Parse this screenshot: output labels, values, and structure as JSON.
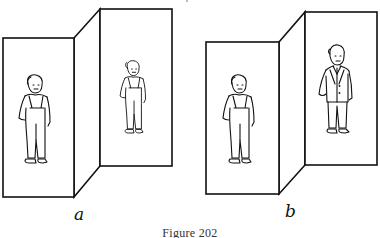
{
  "figure": {
    "caption": "Figure 202",
    "panels": [
      {
        "label": "a",
        "description": "Folding screen with two panels; near panel shows a boy in overalls, far panel shows the same boy drawn smaller",
        "near_figure": "boy-in-overalls",
        "far_figure": "boy-in-overalls-small"
      },
      {
        "label": "b",
        "description": "Folding screen with two panels; near panel shows a boy in overalls, far panel shows a man in a suit of similar drawn size",
        "near_figure": "boy-in-overalls",
        "far_figure": "man-in-suit"
      }
    ]
  },
  "colors": {
    "ink": "#111111",
    "paper": "#ffffff",
    "caption": "#333333"
  }
}
